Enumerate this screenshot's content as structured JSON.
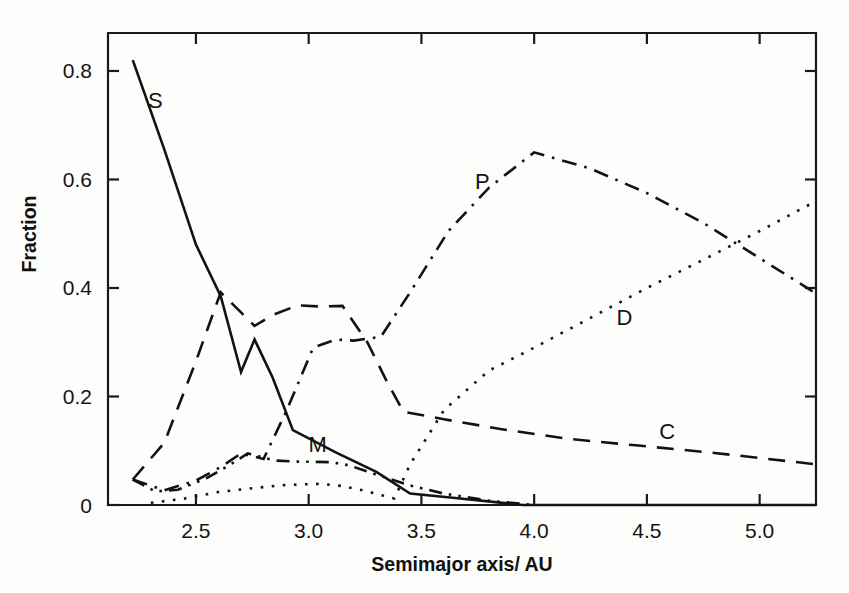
{
  "chart_data": {
    "type": "line",
    "title": "",
    "xlabel": "Semimajor axis/ AU",
    "ylabel": "Fraction",
    "xlim": [
      2.11,
      5.25
    ],
    "ylim": [
      0,
      0.87
    ],
    "grid": false,
    "legend": "inline-labels",
    "xticks": [
      "2.5",
      "3.0",
      "3.5",
      "4.0",
      "4.5",
      "5.0"
    ],
    "xtick_values": [
      2.5,
      3.0,
      3.5,
      4.0,
      4.5,
      5.0
    ],
    "yticks": [
      "0",
      "0.2",
      "0.4",
      "0.6",
      "0.8"
    ],
    "ytick_values": [
      0,
      0.2,
      0.4,
      0.6,
      0.8
    ],
    "series": [
      {
        "name": "S",
        "label": "S",
        "style": "solid",
        "label_x": 2.32,
        "label_y": 0.745,
        "x": [
          2.22,
          2.36,
          2.5,
          2.61,
          2.7,
          2.76,
          2.84,
          2.93,
          3.12,
          3.3,
          3.45,
          3.65,
          3.95,
          5.25
        ],
        "y": [
          0.82,
          0.655,
          0.48,
          0.385,
          0.245,
          0.305,
          0.235,
          0.138,
          0.097,
          0.061,
          0.021,
          0.013,
          0.0,
          0.0
        ]
      },
      {
        "name": "C",
        "label": "C",
        "style": "dashed",
        "label_x": 4.59,
        "label_y": 0.135,
        "x": [
          2.22,
          2.36,
          2.5,
          2.61,
          2.7,
          2.76,
          2.84,
          2.95,
          3.05,
          3.15,
          3.26,
          3.35,
          3.42,
          3.6,
          3.85,
          4.15,
          4.45,
          4.8,
          5.25
        ],
        "y": [
          0.047,
          0.115,
          0.265,
          0.392,
          0.355,
          0.33,
          0.35,
          0.368,
          0.366,
          0.367,
          0.3,
          0.225,
          0.172,
          0.158,
          0.14,
          0.122,
          0.11,
          0.096,
          0.075
        ]
      },
      {
        "name": "P",
        "label": "P",
        "style": "dashdot",
        "label_x": 3.77,
        "label_y": 0.596,
        "x": [
          2.22,
          2.36,
          2.5,
          2.61,
          2.7,
          2.8,
          2.9,
          3.02,
          3.12,
          3.2,
          3.32,
          3.45,
          3.62,
          3.8,
          4.0,
          4.25,
          4.5,
          4.75,
          5.0,
          5.25
        ],
        "y": [
          0.047,
          0.027,
          0.045,
          0.07,
          0.095,
          0.085,
          0.172,
          0.29,
          0.305,
          0.303,
          0.31,
          0.392,
          0.505,
          0.585,
          0.65,
          0.62,
          0.575,
          0.52,
          0.455,
          0.39
        ]
      },
      {
        "name": "D",
        "label": "D",
        "style": "dotted",
        "label_x": 4.4,
        "label_y": 0.345,
        "x": [
          2.3,
          2.45,
          2.6,
          2.75,
          2.9,
          3.05,
          3.15,
          3.25,
          3.38,
          3.45,
          3.6,
          3.8,
          4.0,
          4.25,
          4.5,
          4.75,
          5.0,
          5.25
        ],
        "y": [
          0.004,
          0.012,
          0.024,
          0.031,
          0.037,
          0.039,
          0.035,
          0.026,
          0.012,
          0.075,
          0.175,
          0.248,
          0.29,
          0.345,
          0.4,
          0.452,
          0.505,
          0.56
        ]
      },
      {
        "name": "M",
        "label": "M",
        "style": "dashdotdot",
        "label_x": 3.04,
        "label_y": 0.11,
        "x": [
          2.22,
          2.32,
          2.42,
          2.55,
          2.65,
          2.73,
          2.85,
          2.95,
          3.1,
          3.18,
          3.3,
          3.45,
          3.6,
          3.8,
          3.95,
          4.0
        ],
        "y": [
          0.047,
          0.025,
          0.028,
          0.05,
          0.074,
          0.095,
          0.082,
          0.08,
          0.079,
          0.073,
          0.056,
          0.036,
          0.021,
          0.008,
          0.002,
          0.0
        ]
      }
    ]
  }
}
